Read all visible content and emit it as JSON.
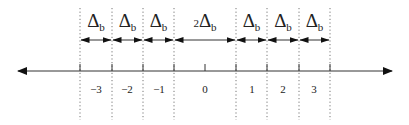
{
  "diagram": {
    "type": "number-line",
    "axis": {
      "y": 71,
      "x_start": 18,
      "x_end": 392,
      "color": "#333333"
    },
    "bin_label": "Δ",
    "bin_subscript": "b",
    "boundaries_x": [
      80,
      112,
      143,
      174,
      236,
      267,
      299,
      330
    ],
    "tick_labels": [
      {
        "x": 96,
        "text": "−3"
      },
      {
        "x": 127,
        "text": "−2"
      },
      {
        "x": 159,
        "text": "−1"
      },
      {
        "x": 205,
        "text": "0"
      },
      {
        "x": 252,
        "text": "1"
      },
      {
        "x": 283,
        "text": "2"
      },
      {
        "x": 314,
        "text": "3"
      }
    ],
    "extra_tick_x": 205,
    "intervals": [
      {
        "x1": 80,
        "x2": 112,
        "prefix": "",
        "label": "Δ",
        "sub": "b"
      },
      {
        "x1": 112,
        "x2": 143,
        "prefix": "",
        "label": "Δ",
        "sub": "b"
      },
      {
        "x1": 143,
        "x2": 174,
        "prefix": "",
        "label": "Δ",
        "sub": "b"
      },
      {
        "x1": 174,
        "x2": 236,
        "prefix": "2",
        "label": "Δ",
        "sub": "b"
      },
      {
        "x1": 236,
        "x2": 267,
        "prefix": "",
        "label": "Δ",
        "sub": "b"
      },
      {
        "x1": 267,
        "x2": 299,
        "prefix": "",
        "label": "Δ",
        "sub": "b"
      },
      {
        "x1": 299,
        "x2": 330,
        "prefix": "",
        "label": "Δ",
        "sub": "b"
      }
    ]
  }
}
